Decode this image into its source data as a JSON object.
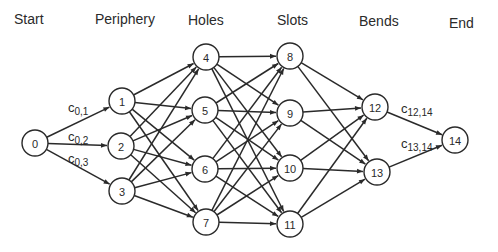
{
  "stages": [
    {
      "id": "start",
      "label": "Start",
      "x": 14,
      "y": 24
    },
    {
      "id": "periphery",
      "label": "Periphery",
      "x": 95,
      "y": 24
    },
    {
      "id": "holes",
      "label": "Holes",
      "x": 188,
      "y": 25
    },
    {
      "id": "slots",
      "label": "Slots",
      "x": 277,
      "y": 25
    },
    {
      "id": "bends",
      "label": "Bends",
      "x": 359,
      "y": 26
    },
    {
      "id": "end",
      "label": "End",
      "x": 449,
      "y": 28
    }
  ],
  "nodes": [
    {
      "id": "0",
      "label": "0",
      "x": 35,
      "y": 143,
      "stage": "start"
    },
    {
      "id": "1",
      "label": "1",
      "x": 122,
      "y": 101,
      "stage": "periphery"
    },
    {
      "id": "2",
      "label": "2",
      "x": 121,
      "y": 146,
      "stage": "periphery"
    },
    {
      "id": "3",
      "label": "3",
      "x": 122,
      "y": 191,
      "stage": "periphery"
    },
    {
      "id": "4",
      "label": "4",
      "x": 206,
      "y": 57,
      "stage": "holes"
    },
    {
      "id": "5",
      "label": "5",
      "x": 205,
      "y": 110,
      "stage": "holes"
    },
    {
      "id": "6",
      "label": "6",
      "x": 205,
      "y": 169,
      "stage": "holes"
    },
    {
      "id": "7",
      "label": "7",
      "x": 206,
      "y": 222,
      "stage": "holes"
    },
    {
      "id": "8",
      "label": "8",
      "x": 290,
      "y": 56,
      "stage": "slots"
    },
    {
      "id": "9",
      "label": "9",
      "x": 290,
      "y": 113,
      "stage": "slots"
    },
    {
      "id": "10",
      "label": "10",
      "x": 290,
      "y": 168,
      "stage": "slots"
    },
    {
      "id": "11",
      "label": "11",
      "x": 290,
      "y": 224,
      "stage": "slots"
    },
    {
      "id": "12",
      "label": "12",
      "x": 375,
      "y": 107,
      "stage": "bends"
    },
    {
      "id": "13",
      "label": "13",
      "x": 377,
      "y": 172,
      "stage": "bends"
    },
    {
      "id": "14",
      "label": "14",
      "x": 455,
      "y": 140,
      "stage": "end"
    }
  ],
  "node_radius": 13,
  "edges": [
    [
      "0",
      "1"
    ],
    [
      "0",
      "2"
    ],
    [
      "0",
      "3"
    ],
    [
      "1",
      "4"
    ],
    [
      "1",
      "5"
    ],
    [
      "1",
      "6"
    ],
    [
      "1",
      "7"
    ],
    [
      "2",
      "4"
    ],
    [
      "2",
      "5"
    ],
    [
      "2",
      "6"
    ],
    [
      "2",
      "7"
    ],
    [
      "3",
      "4"
    ],
    [
      "3",
      "5"
    ],
    [
      "3",
      "6"
    ],
    [
      "3",
      "7"
    ],
    [
      "4",
      "8"
    ],
    [
      "4",
      "9"
    ],
    [
      "4",
      "10"
    ],
    [
      "4",
      "11"
    ],
    [
      "5",
      "8"
    ],
    [
      "5",
      "9"
    ],
    [
      "5",
      "10"
    ],
    [
      "5",
      "11"
    ],
    [
      "6",
      "8"
    ],
    [
      "6",
      "9"
    ],
    [
      "6",
      "10"
    ],
    [
      "6",
      "11"
    ],
    [
      "7",
      "8"
    ],
    [
      "7",
      "9"
    ],
    [
      "7",
      "10"
    ],
    [
      "7",
      "11"
    ],
    [
      "8",
      "12"
    ],
    [
      "8",
      "13"
    ],
    [
      "9",
      "12"
    ],
    [
      "9",
      "13"
    ],
    [
      "10",
      "12"
    ],
    [
      "10",
      "13"
    ],
    [
      "11",
      "12"
    ],
    [
      "11",
      "13"
    ],
    [
      "12",
      "14"
    ],
    [
      "13",
      "14"
    ]
  ],
  "edge_labels": [
    {
      "edge": "0-1",
      "base": "c",
      "sub": "0,1",
      "x": 68,
      "y": 112
    },
    {
      "edge": "0-2",
      "base": "c",
      "sub": "0,2",
      "x": 68,
      "y": 141
    },
    {
      "edge": "0-3",
      "base": "c",
      "sub": "0,3",
      "x": 68,
      "y": 163
    },
    {
      "edge": "12-14",
      "base": "c",
      "sub": "12,14",
      "x": 401,
      "y": 113
    },
    {
      "edge": "13-14",
      "base": "c",
      "sub": "13,14",
      "x": 401,
      "y": 148
    }
  ],
  "colors": {
    "stroke": "#2a2a2a",
    "background": "#ffffff"
  }
}
